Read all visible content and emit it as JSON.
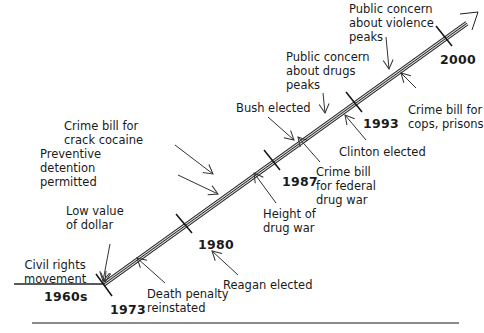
{
  "diagram": {
    "type": "timeline",
    "years": [
      {
        "label": "1960s",
        "x": 44,
        "y": 289
      },
      {
        "label": "1973",
        "x": 110,
        "y": 302
      },
      {
        "label": "1980",
        "x": 198,
        "y": 237
      },
      {
        "label": "1987",
        "x": 282,
        "y": 174
      },
      {
        "label": "1993",
        "x": 363,
        "y": 116
      },
      {
        "label": "2000",
        "x": 440,
        "y": 52
      }
    ],
    "events": [
      {
        "text": "Civil rights\nmovement",
        "x": 24,
        "y": 258
      },
      {
        "text": "Low value\nof dollar",
        "x": 66,
        "y": 204
      },
      {
        "text": "Death penalty\nreinstated",
        "x": 147,
        "y": 287
      },
      {
        "text": "Reagan elected",
        "x": 223,
        "y": 278
      },
      {
        "text": "Preventive\ndetention\npermitted",
        "x": 40,
        "y": 147
      },
      {
        "text": "Crime bill for\ncrack cocaine",
        "x": 64,
        "y": 119
      },
      {
        "text": "Height of\ndrug war",
        "x": 263,
        "y": 207
      },
      {
        "text": "Bush elected",
        "x": 236,
        "y": 101
      },
      {
        "text": "Crime bill\nfor federal\ndrug war",
        "x": 316,
        "y": 165
      },
      {
        "text": "Public concern\nabout drugs\npeaks",
        "x": 286,
        "y": 50
      },
      {
        "text": "Clinton elected",
        "x": 339,
        "y": 145
      },
      {
        "text": "Public concern\nabout violence\npeaks",
        "x": 349,
        "y": 2
      },
      {
        "text": "Crime bill for\ncops, prisons",
        "x": 408,
        "y": 103
      }
    ]
  }
}
